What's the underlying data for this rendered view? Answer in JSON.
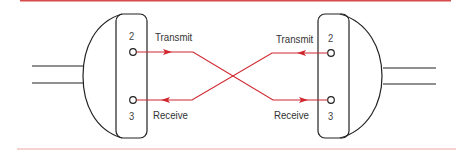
{
  "diagram": {
    "type": "null-modem crossover wiring",
    "colors": {
      "wire": "#d0272f",
      "outline": "#222222",
      "rule": "#e88b8b",
      "text": "#333333"
    },
    "left_connector": {
      "pins": [
        {
          "number": "2",
          "label": "Transmit",
          "direction": "out"
        },
        {
          "number": "3",
          "label": "Receive",
          "direction": "in"
        }
      ]
    },
    "right_connector": {
      "pins": [
        {
          "number": "2",
          "label": "Transmit",
          "direction": "out"
        },
        {
          "number": "3",
          "label": "Receive",
          "direction": "in"
        }
      ]
    },
    "connections": [
      {
        "from": "left.2 Transmit",
        "to": "right.3 Receive"
      },
      {
        "from": "right.2 Transmit",
        "to": "left.3 Receive"
      }
    ]
  }
}
